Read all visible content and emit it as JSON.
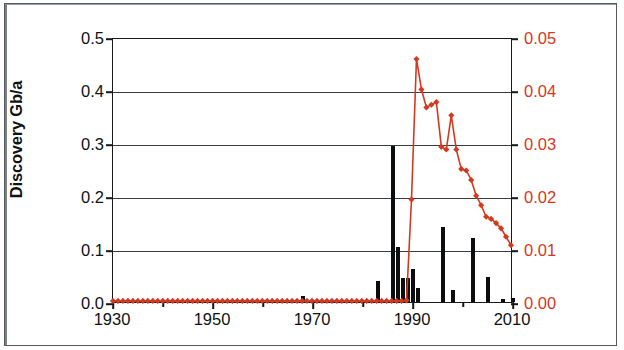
{
  "chart_data": {
    "type": "bar",
    "title": "",
    "subtitle": "",
    "xlabel": "",
    "ylabel": "Discovery Gb/a",
    "y2label": "Production Gb/a",
    "grid": true,
    "legend": "none",
    "xlim": [
      1930,
      2010
    ],
    "ylim": [
      0.0,
      0.5
    ],
    "y2lim": [
      0.0,
      0.05
    ],
    "x_tick_labels": [
      "1930",
      "1950",
      "1970",
      "1990",
      "2010"
    ],
    "x_tick_values": [
      1930,
      1950,
      1970,
      1990,
      2010
    ],
    "x_minor_tick_values": [
      1940,
      1960,
      1980,
      2000
    ],
    "y_tick_labels": [
      "0.0",
      "0.1",
      "0.2",
      "0.3",
      "0.4",
      "0.5"
    ],
    "y_tick_values": [
      0.0,
      0.1,
      0.2,
      0.3,
      0.4,
      0.5
    ],
    "y2_tick_labels": [
      "0.00",
      "0.01",
      "0.02",
      "0.03",
      "0.04",
      "0.05"
    ],
    "y2_tick_values": [
      0.0,
      0.01,
      0.02,
      0.03,
      0.04,
      0.05
    ],
    "colors": {
      "bars": "#0c0d0f",
      "line": "#d3391f",
      "marker": "#d3391f",
      "axis": "#16181a",
      "grid": "#3a3d40",
      "background": "#ffffff"
    },
    "series": [
      {
        "name": "Discovery Gb/a",
        "type": "bar",
        "axis": "left",
        "color": "#0c0d0f",
        "x": [
          1930,
          1931,
          1932,
          1933,
          1934,
          1935,
          1936,
          1937,
          1938,
          1939,
          1940,
          1941,
          1942,
          1943,
          1944,
          1945,
          1946,
          1947,
          1948,
          1949,
          1950,
          1951,
          1952,
          1953,
          1954,
          1955,
          1956,
          1957,
          1958,
          1959,
          1960,
          1961,
          1962,
          1963,
          1964,
          1965,
          1966,
          1967,
          1968,
          1969,
          1970,
          1971,
          1972,
          1973,
          1974,
          1975,
          1976,
          1977,
          1978,
          1979,
          1980,
          1981,
          1982,
          1983,
          1984,
          1985,
          1986,
          1987,
          1988,
          1989,
          1990,
          1991,
          1992,
          1993,
          1994,
          1995,
          1996,
          1997,
          1998,
          1999,
          2000,
          2001,
          2002,
          2003,
          2004,
          2005,
          2006,
          2007,
          2008,
          2009,
          2010
        ],
        "values": [
          0,
          0,
          0,
          0,
          0,
          0,
          0,
          0,
          0,
          0,
          0,
          0,
          0,
          0,
          0,
          0,
          0,
          0,
          0,
          0,
          0,
          0,
          0,
          0,
          0,
          0,
          0,
          0,
          0,
          0,
          0,
          0,
          0,
          0,
          0,
          0,
          0,
          0,
          0.012,
          0,
          0,
          0,
          0,
          0,
          0,
          0,
          0,
          0,
          0,
          0,
          0,
          0,
          0,
          0.039,
          0,
          0,
          0.294,
          0.103,
          0.045,
          0.046,
          0.062,
          0.027,
          0,
          0,
          0,
          0,
          0.142,
          0,
          0.022,
          0,
          0,
          0,
          0.12,
          0,
          0,
          0.047,
          0,
          0,
          0.005,
          0,
          0.008
        ]
      },
      {
        "name": "Production Gb/a",
        "type": "line",
        "axis": "right",
        "color": "#d3391f",
        "marker": "diamond",
        "x": [
          1930,
          1931,
          1932,
          1933,
          1934,
          1935,
          1936,
          1937,
          1938,
          1939,
          1940,
          1941,
          1942,
          1943,
          1944,
          1945,
          1946,
          1947,
          1948,
          1949,
          1950,
          1951,
          1952,
          1953,
          1954,
          1955,
          1956,
          1957,
          1958,
          1959,
          1960,
          1961,
          1962,
          1963,
          1964,
          1965,
          1966,
          1967,
          1968,
          1969,
          1970,
          1971,
          1972,
          1973,
          1974,
          1975,
          1976,
          1977,
          1978,
          1979,
          1980,
          1981,
          1982,
          1983,
          1984,
          1985,
          1986,
          1987,
          1988,
          1989,
          1990,
          1991,
          1992,
          1993,
          1994,
          1995,
          1996,
          1997,
          1998,
          1999,
          2000,
          2001,
          2002,
          2003,
          2004,
          2005,
          2006,
          2007,
          2008,
          2009,
          2010
        ],
        "values": [
          0.0002,
          0.0002,
          0.0002,
          0.0002,
          0.0002,
          0.0002,
          0.0002,
          0.0002,
          0.0002,
          0.0002,
          0.0002,
          0.0002,
          0.0002,
          0.0002,
          0.0002,
          0.0002,
          0.0002,
          0.0002,
          0.0002,
          0.0002,
          0.0002,
          0.0002,
          0.0002,
          0.0002,
          0.0002,
          0.0002,
          0.0002,
          0.0002,
          0.0002,
          0.0002,
          0.0002,
          0.0002,
          0.0002,
          0.0002,
          0.0002,
          0.0002,
          0.0002,
          0.0002,
          0.0002,
          0.0002,
          0.0002,
          0.0002,
          0.0002,
          0.0002,
          0.0002,
          0.0002,
          0.0002,
          0.0002,
          0.0002,
          0.0002,
          0.0002,
          0.0002,
          0.0002,
          0.0002,
          0.0002,
          0.0002,
          0.0002,
          0.0002,
          0.0002,
          0.0003,
          0.0195,
          0.0462,
          0.0404,
          0.037,
          0.0375,
          0.038,
          0.0295,
          0.029,
          0.0355,
          0.029,
          0.0253,
          0.025,
          0.0232,
          0.0202,
          0.0184,
          0.0162,
          0.0158,
          0.015,
          0.014,
          0.0124,
          0.0108
        ]
      }
    ]
  },
  "axes": {
    "left": {
      "title": "Discovery Gb/a"
    },
    "right": {
      "title": "Production Gb/a"
    }
  }
}
